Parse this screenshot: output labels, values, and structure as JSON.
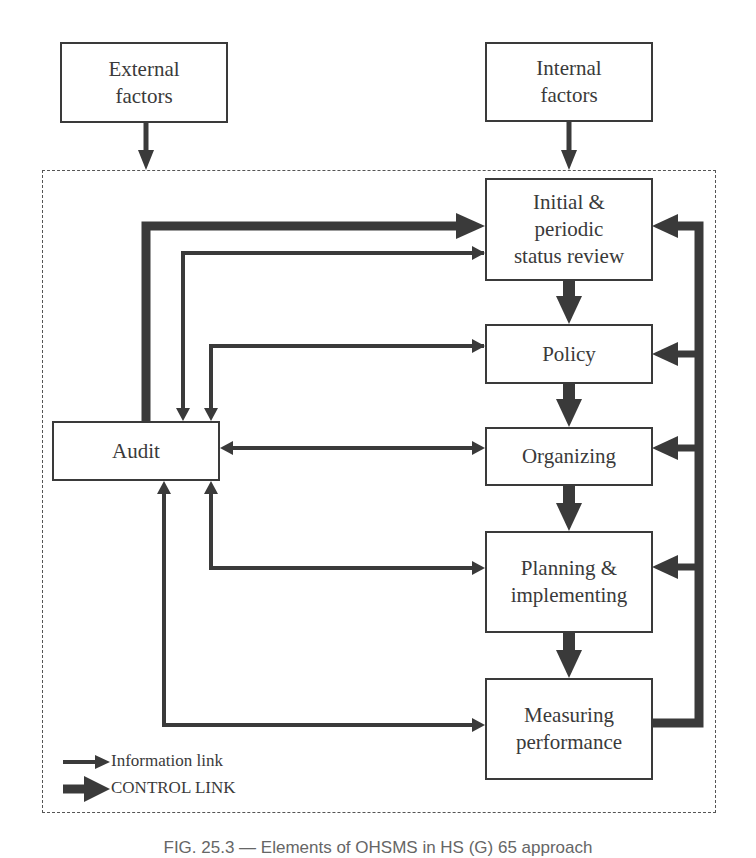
{
  "diagram": {
    "type": "flow",
    "title_caption": "FIG. 25.3 — Elements of OHSMS in HS (G) 65 approach",
    "colors": {
      "line": "#3a3a3a",
      "border": "#555555",
      "background": "#ffffff"
    },
    "nodes": {
      "external": {
        "label": "External\nfactors"
      },
      "internal": {
        "label": "Internal\nfactors"
      },
      "initial": {
        "label": "Initial &\nperiodic\nstatus review"
      },
      "policy": {
        "label": "Policy"
      },
      "organizing": {
        "label": "Organizing"
      },
      "planning": {
        "label": "Planning &\nimplementing"
      },
      "measuring": {
        "label": "Measuring\nperformance"
      },
      "audit": {
        "label": "Audit"
      }
    },
    "edges": [
      {
        "from": "external",
        "to": "system_boundary",
        "kind": "control"
      },
      {
        "from": "internal",
        "to": "initial",
        "kind": "control"
      },
      {
        "from": "initial",
        "to": "policy",
        "kind": "control"
      },
      {
        "from": "policy",
        "to": "organizing",
        "kind": "control"
      },
      {
        "from": "organizing",
        "to": "planning",
        "kind": "control"
      },
      {
        "from": "planning",
        "to": "measuring",
        "kind": "control"
      },
      {
        "from": "measuring",
        "to": [
          "initial",
          "policy",
          "organizing",
          "planning"
        ],
        "kind": "control"
      },
      {
        "from": "audit",
        "to": "initial",
        "kind": "control"
      },
      {
        "from": "initial",
        "to": "audit",
        "kind": "information"
      },
      {
        "from": "policy",
        "to": "audit",
        "kind": "information",
        "bidirectional": true
      },
      {
        "from": "organizing",
        "to": "audit",
        "kind": "information",
        "bidirectional": true
      },
      {
        "from": "planning",
        "to": "audit",
        "kind": "information",
        "bidirectional": true
      },
      {
        "from": "measuring",
        "to": "audit",
        "kind": "information",
        "bidirectional": true
      }
    ],
    "legend": {
      "information": "Information link",
      "control": "CONTROL LINK"
    }
  }
}
